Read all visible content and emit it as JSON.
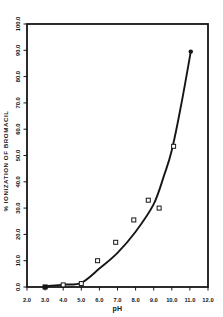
{
  "figure": {
    "background": "#ffffff",
    "ink": "#161616"
  },
  "chart_data": {
    "type": "scatter",
    "title": "",
    "xlabel": "pH",
    "ylabel": "% IONIZATION OF BROMACIL",
    "xlim": [
      2.0,
      12.0
    ],
    "ylim": [
      0.0,
      100.0
    ],
    "grid": false,
    "frame": true,
    "legend": "none",
    "x_ticks": [
      "2.0",
      "3.0",
      "4.0",
      "5.0",
      "6.0",
      "7.0",
      "8.0",
      "9.0",
      "10.0",
      "11.0",
      "12.0"
    ],
    "y_ticks": [
      "0.0",
      "10.0",
      "20.0",
      "30.0",
      "40.0",
      "50.0",
      "60.0",
      "70.0",
      "80.0",
      "90.0",
      "100.0"
    ],
    "series": [
      {
        "name": "observed-ionization",
        "marker": "open-square",
        "points": [
          [
            4.0,
            0.8
          ],
          [
            5.0,
            1.3
          ],
          [
            5.9,
            10.0
          ],
          [
            6.9,
            17.0
          ],
          [
            7.9,
            25.5
          ],
          [
            8.7,
            33.0
          ],
          [
            9.3,
            30.0
          ],
          [
            10.1,
            53.5
          ]
        ]
      },
      {
        "name": "curve-start-point",
        "marker": "filled-square",
        "points": [
          [
            3.0,
            0.0
          ]
        ]
      },
      {
        "name": "curve-end-point",
        "marker": "filled-dot",
        "points": [
          [
            11.05,
            89.5
          ]
        ]
      }
    ],
    "curve": {
      "name": "fitted-ionization-curve",
      "points": [
        [
          3.0,
          0.3
        ],
        [
          4.0,
          0.9
        ],
        [
          5.0,
          1.6
        ],
        [
          6.0,
          7.0
        ],
        [
          7.0,
          13.0
        ],
        [
          8.0,
          21.0
        ],
        [
          9.0,
          31.5
        ],
        [
          9.6,
          43.0
        ],
        [
          10.0,
          52.0
        ],
        [
          10.5,
          68.5
        ],
        [
          11.05,
          89.5
        ]
      ]
    }
  }
}
